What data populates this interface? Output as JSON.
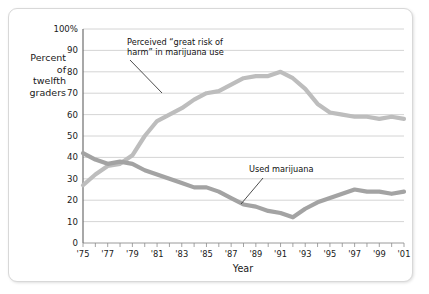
{
  "figure": {
    "background_color": "#ffffff",
    "border_color": "#d8d8d8"
  },
  "axes": {
    "y_title_lines": [
      "Percent",
      "of",
      "twelfth",
      "graders"
    ],
    "x_title": "Year",
    "y_ticks": [
      "0",
      "10",
      "20",
      "30",
      "40",
      "50",
      "60",
      "70",
      "80",
      "90",
      "100%"
    ],
    "x_ticks": [
      "'75",
      "'77",
      "'79",
      "'81",
      "'83",
      "'85",
      "'87",
      "'89",
      "'91",
      "'93",
      "'95",
      "'97",
      "'99",
      "'01"
    ]
  },
  "annotations": {
    "risk_line1": "Perceived “great risk of",
    "risk_line2": "harm” in marijuana use",
    "use_label": "Used marijuana"
  },
  "chart_data": {
    "type": "line",
    "title": "",
    "xlabel": "Year",
    "ylabel": "Percent of twelfth graders",
    "xlim": [
      1975,
      2001
    ],
    "ylim": [
      0,
      100
    ],
    "grid": true,
    "legend_position": "inline-annotations",
    "x": [
      1975,
      1976,
      1977,
      1978,
      1979,
      1980,
      1981,
      1982,
      1983,
      1984,
      1985,
      1986,
      1987,
      1988,
      1989,
      1990,
      1991,
      1992,
      1993,
      1994,
      1995,
      1996,
      1997,
      1998,
      1999,
      2000,
      2001
    ],
    "series": [
      {
        "name": "Perceived “great risk of harm” in marijuana use",
        "color": "#bdbdbd",
        "values": [
          27,
          32,
          36,
          37,
          41,
          50,
          57,
          60,
          63,
          67,
          70,
          71,
          74,
          77,
          78,
          78,
          80,
          77,
          72,
          65,
          61,
          60,
          59,
          59,
          58,
          59,
          58
        ]
      },
      {
        "name": "Used marijuana",
        "color": "#a3a3a3",
        "values": [
          42,
          39,
          37,
          38,
          37,
          34,
          32,
          30,
          28,
          26,
          26,
          24,
          21,
          18,
          17,
          15,
          14,
          12,
          16,
          19,
          21,
          23,
          25,
          24,
          24,
          23,
          24
        ]
      }
    ],
    "annotations": [
      {
        "text": "Perceived “great risk of harm” in marijuana use",
        "points_to_x": 1985,
        "points_to_y": 70
      },
      {
        "text": "Used marijuana",
        "points_to_x": 1989,
        "points_to_y": 17
      }
    ]
  }
}
